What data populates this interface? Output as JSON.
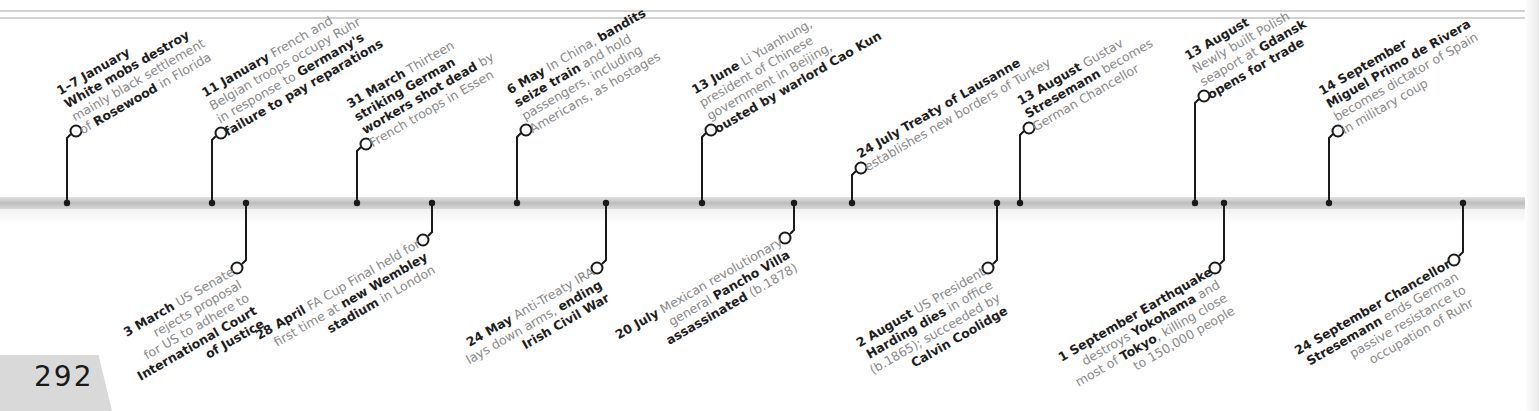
{
  "page": {
    "number": "292"
  },
  "colors": {
    "bold_text": "#1e1e1e",
    "body_text": "#8a8a8a",
    "connector": "#1a1a1a",
    "bar": "#c8c8c8",
    "page_tab": "#d9d9d9"
  },
  "timeline": {
    "above": [
      {
        "x": 67,
        "lines": [
          [
            {
              "t": "1–7 January",
              "b": true
            }
          ],
          [
            {
              "t": "White mobs destroy",
              "b": true
            }
          ],
          [
            {
              "t": "mainly black settlement",
              "b": false
            }
          ],
          [
            {
              "t": "of ",
              "b": false
            },
            {
              "t": "Rosewood",
              "b": true
            },
            {
              "t": " in Florida",
              "b": false
            }
          ]
        ]
      },
      {
        "x": 212,
        "lines": [
          [
            {
              "t": "11 January",
              "b": true
            },
            {
              "t": " French and",
              "b": false
            }
          ],
          [
            {
              "t": "Belgian troops occupy Ruhr",
              "b": false
            }
          ],
          [
            {
              "t": "in response to ",
              "b": false
            },
            {
              "t": "Germany's",
              "b": true
            }
          ],
          [
            {
              "t": "failure to pay reparations",
              "b": true
            }
          ]
        ]
      },
      {
        "x": 357,
        "lines": [
          [
            {
              "t": "31 March",
              "b": true
            },
            {
              "t": " Thirteen",
              "b": false
            }
          ],
          [
            {
              "t": "striking German",
              "b": true
            }
          ],
          [
            {
              "t": "workers shot dead",
              "b": true
            },
            {
              "t": " by",
              "b": false
            }
          ],
          [
            {
              "t": "French troops in Essen",
              "b": false
            }
          ]
        ]
      },
      {
        "x": 517,
        "lines": [
          [
            {
              "t": "6 May",
              "b": true
            },
            {
              "t": " In China, ",
              "b": false
            },
            {
              "t": "bandits",
              "b": true
            }
          ],
          [
            {
              "t": "seize train",
              "b": true
            },
            {
              "t": " and hold",
              "b": false
            }
          ],
          [
            {
              "t": "passengers, including",
              "b": false
            }
          ],
          [
            {
              "t": "Americans, as hostages",
              "b": false
            }
          ]
        ]
      },
      {
        "x": 702,
        "lines": [
          [
            {
              "t": "13 June",
              "b": true
            },
            {
              "t": " Li Yuanhung,",
              "b": false
            }
          ],
          [
            {
              "t": "president of Chinese",
              "b": false
            }
          ],
          [
            {
              "t": "government in Beijing,",
              "b": false
            }
          ],
          [
            {
              "t": "ousted by warlord Cao Kun",
              "b": true
            }
          ]
        ]
      },
      {
        "x": 852,
        "lines": [
          [
            {
              "t": "24 July",
              "b": true
            },
            {
              "t": " ",
              "b": false
            },
            {
              "t": "Treaty of Lausanne",
              "b": true
            }
          ],
          [
            {
              "t": "establishes new borders of Turkey",
              "b": false
            }
          ]
        ]
      },
      {
        "x": 1020,
        "lines": [
          [
            {
              "t": "13 August",
              "b": true
            },
            {
              "t": " Gustav",
              "b": false
            }
          ],
          [
            {
              "t": "Stresemann",
              "b": true
            },
            {
              "t": " becomes",
              "b": false
            }
          ],
          [
            {
              "t": "German Chancellor",
              "b": false
            }
          ]
        ]
      },
      {
        "x": 1195,
        "lines": [
          [
            {
              "t": "13 August",
              "b": true
            }
          ],
          [
            {
              "t": "Newly built Polish",
              "b": false
            }
          ],
          [
            {
              "t": "seaport at ",
              "b": false
            },
            {
              "t": "Gdansk",
              "b": true
            }
          ],
          [
            {
              "t": "opens for trade",
              "b": true
            }
          ]
        ]
      },
      {
        "x": 1329,
        "lines": [
          [
            {
              "t": "14 September",
              "b": true
            }
          ],
          [
            {
              "t": "Miguel Primo de Rivera",
              "b": true
            }
          ],
          [
            {
              "t": "becomes dictator of Spain",
              "b": false
            }
          ],
          [
            {
              "t": "in military coup",
              "b": false
            }
          ]
        ]
      }
    ],
    "below": [
      {
        "x": 246,
        "lines": [
          [
            {
              "t": "3 March",
              "b": true
            },
            {
              "t": " US Senate",
              "b": false
            }
          ],
          [
            {
              "t": "rejects proposal",
              "b": false
            }
          ],
          [
            {
              "t": "for US to adhere to",
              "b": false
            }
          ],
          [
            {
              "t": "International Court",
              "b": true
            }
          ],
          [
            {
              "t": "of Justice",
              "b": true
            }
          ]
        ]
      },
      {
        "x": 432,
        "lines": [
          [
            {
              "t": "28 April",
              "b": true
            },
            {
              "t": " FA Cup Final held for",
              "b": false
            }
          ],
          [
            {
              "t": "first time at ",
              "b": false
            },
            {
              "t": "new Wembley",
              "b": true
            }
          ],
          [
            {
              "t": "stadium",
              "b": true
            },
            {
              "t": " in London",
              "b": false
            }
          ]
        ]
      },
      {
        "x": 606,
        "lines": [
          [
            {
              "t": "24 May",
              "b": true
            },
            {
              "t": " Anti-Treaty IRA",
              "b": false
            }
          ],
          [
            {
              "t": "lays down arms, ",
              "b": false
            },
            {
              "t": "ending",
              "b": true
            }
          ],
          [
            {
              "t": "Irish Civil War",
              "b": true
            }
          ]
        ]
      },
      {
        "x": 794,
        "lines": [
          [
            {
              "t": "20 July",
              "b": true
            },
            {
              "t": " Mexican revolutionary",
              "b": false
            }
          ],
          [
            {
              "t": "general ",
              "b": false
            },
            {
              "t": "Pancho Villa",
              "b": true
            }
          ],
          [
            {
              "t": "assassinated",
              "b": true
            },
            {
              "t": " (b.1878)",
              "b": false
            }
          ]
        ]
      },
      {
        "x": 997,
        "lines": [
          [
            {
              "t": "2 August",
              "b": true
            },
            {
              "t": " US President",
              "b": false
            }
          ],
          [
            {
              "t": "Harding dies",
              "b": true
            },
            {
              "t": " in office",
              "b": false
            }
          ],
          [
            {
              "t": "(b.1865); succeeded by",
              "b": false
            }
          ],
          [
            {
              "t": "Calvin Coolidge",
              "b": true
            }
          ]
        ]
      },
      {
        "x": 1224,
        "lines": [
          [
            {
              "t": "1 September",
              "b": true
            },
            {
              "t": " ",
              "b": false
            },
            {
              "t": "Earthquake",
              "b": true
            }
          ],
          [
            {
              "t": "destroys ",
              "b": false
            },
            {
              "t": "Yokohama",
              "b": true
            },
            {
              "t": " and",
              "b": false
            }
          ],
          [
            {
              "t": "most of ",
              "b": false
            },
            {
              "t": "Tokyo",
              "b": true
            },
            {
              "t": ", killing close",
              "b": false
            }
          ],
          [
            {
              "t": "to 150,000 people",
              "b": false
            }
          ]
        ]
      },
      {
        "x": 1463,
        "lines": [
          [
            {
              "t": "24 September",
              "b": true
            },
            {
              "t": " ",
              "b": false
            },
            {
              "t": "Chancellor",
              "b": true
            }
          ],
          [
            {
              "t": "Stresemann",
              "b": true
            },
            {
              "t": " ends German",
              "b": false
            }
          ],
          [
            {
              "t": "passive resistance to",
              "b": false
            }
          ],
          [
            {
              "t": "occupation of Ruhr",
              "b": false
            }
          ]
        ]
      }
    ]
  }
}
